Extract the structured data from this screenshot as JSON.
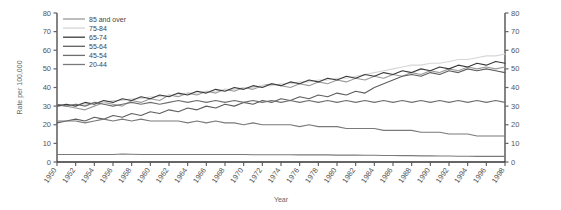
{
  "chart_data": {
    "type": "line",
    "title": "",
    "xlabel": "Year",
    "ylabel": "Rate per 100,000",
    "ylim": [
      0,
      80
    ],
    "ytick_step": 10,
    "yticks": [
      0,
      10,
      20,
      30,
      40,
      50,
      60,
      70,
      80
    ],
    "grid": false,
    "legend_position": "top-left",
    "dual_y_axis": true,
    "x": [
      1950,
      1951,
      1952,
      1953,
      1954,
      1955,
      1956,
      1957,
      1958,
      1959,
      1960,
      1961,
      1962,
      1963,
      1964,
      1965,
      1966,
      1967,
      1968,
      1969,
      1970,
      1971,
      1972,
      1973,
      1974,
      1975,
      1976,
      1977,
      1978,
      1979,
      1980,
      1981,
      1982,
      1983,
      1984,
      1985,
      1986,
      1987,
      1988,
      1989,
      1990,
      1991,
      1992,
      1993,
      1994,
      1995,
      1996,
      1997,
      1998
    ],
    "xtick_labels": [
      "1950",
      "1952",
      "1954",
      "1956",
      "1958",
      "1960",
      "1962",
      "1964",
      "1966",
      "1968",
      "1970",
      "1972",
      "1974",
      "1976",
      "1978",
      "1980",
      "1982",
      "1984",
      "1986",
      "1988",
      "1990",
      "1992",
      "1994",
      "1996",
      "1998"
    ],
    "series": [
      {
        "name": "85 and over",
        "color": "#9a9a9a",
        "values": [
          31,
          30,
          29,
          28,
          30,
          32,
          31,
          30,
          33,
          32,
          34,
          33,
          36,
          35,
          37,
          36,
          38,
          37,
          39,
          38,
          40,
          39,
          41,
          42,
          41,
          40,
          42,
          41,
          43,
          42,
          44,
          43,
          45,
          44,
          46,
          45,
          47,
          46,
          48,
          47,
          49,
          48,
          50,
          49,
          51,
          50,
          51,
          50,
          51
        ]
      },
      {
        "name": "75-84",
        "color": "#d6d6d6",
        "values": [
          30,
          30,
          31,
          31,
          32,
          32,
          33,
          33,
          34,
          34,
          35,
          35,
          36,
          36,
          37,
          37,
          38,
          38,
          39,
          39,
          40,
          40,
          41,
          41,
          42,
          42,
          43,
          43,
          44,
          44,
          45,
          45,
          46,
          47,
          48,
          49,
          50,
          51,
          52,
          52,
          53,
          53,
          54,
          55,
          55,
          56,
          57,
          57,
          58
        ]
      },
      {
        "name": "65-74",
        "color": "#3a3a3a",
        "values": [
          30,
          31,
          30,
          32,
          31,
          33,
          32,
          34,
          33,
          35,
          34,
          36,
          35,
          37,
          36,
          38,
          37,
          39,
          38,
          40,
          39,
          41,
          40,
          42,
          41,
          43,
          42,
          44,
          43,
          45,
          44,
          46,
          45,
          47,
          46,
          48,
          47,
          49,
          48,
          50,
          49,
          51,
          50,
          52,
          51,
          53,
          52,
          54,
          53
        ]
      },
      {
        "name": "55-64",
        "color": "#5e5e5e",
        "values": [
          21,
          22,
          23,
          22,
          24,
          23,
          25,
          24,
          26,
          25,
          27,
          26,
          28,
          27,
          29,
          28,
          30,
          29,
          31,
          30,
          32,
          31,
          33,
          32,
          34,
          33,
          35,
          34,
          36,
          35,
          37,
          36,
          38,
          37,
          40,
          42,
          44,
          46,
          47,
          46,
          48,
          47,
          49,
          48,
          50,
          49,
          50,
          49,
          48
        ]
      },
      {
        "name": "45-54",
        "color": "#6e6e6e",
        "values": [
          31,
          30,
          31,
          30,
          32,
          31,
          30,
          31,
          32,
          31,
          32,
          31,
          32,
          33,
          32,
          33,
          32,
          33,
          32,
          33,
          32,
          33,
          32,
          33,
          32,
          33,
          32,
          33,
          32,
          33,
          32,
          33,
          32,
          33,
          32,
          33,
          32,
          33,
          32,
          33,
          32,
          33,
          32,
          33,
          32,
          33,
          32,
          33,
          32
        ]
      },
      {
        "name": "20-44",
        "color": "#7a7a7a",
        "values": [
          22,
          22,
          22,
          21,
          22,
          23,
          22,
          23,
          22,
          23,
          22,
          22,
          22,
          22,
          21,
          22,
          21,
          22,
          21,
          21,
          20,
          21,
          20,
          20,
          20,
          20,
          19,
          20,
          19,
          19,
          19,
          18,
          18,
          18,
          18,
          17,
          17,
          17,
          17,
          16,
          16,
          16,
          15,
          15,
          15,
          14,
          14,
          14,
          14
        ]
      },
      {
        "name": "20-44-low",
        "color": "#7a7a7a",
        "values": [
          4,
          4,
          4,
          4,
          4,
          4,
          4,
          4.3,
          4.2,
          4,
          4,
          4,
          4,
          4,
          4,
          4,
          4,
          4,
          4,
          4,
          4,
          3.9,
          3.9,
          3.9,
          3.9,
          3.9,
          3.8,
          3.8,
          3.8,
          3.8,
          3.7,
          3.7,
          3.7,
          3.6,
          3.6,
          3.5,
          3.5,
          3.4,
          3.4,
          3.3,
          3.3,
          3.2,
          3.2,
          3.1,
          3.1,
          3,
          3,
          3,
          3
        ]
      }
    ],
    "legend_entries": [
      {
        "label": "85 and over",
        "color": "#9a9a9a"
      },
      {
        "label": "75-84",
        "color": "#d6d6d6"
      },
      {
        "label": "65-74",
        "color": "#3a3a3a"
      },
      {
        "label": "55-64",
        "color": "#5e5e5e"
      },
      {
        "label": "45-54",
        "color": "#6e6e6e"
      },
      {
        "label": "20-44",
        "color": "#7a7a7a"
      }
    ]
  }
}
